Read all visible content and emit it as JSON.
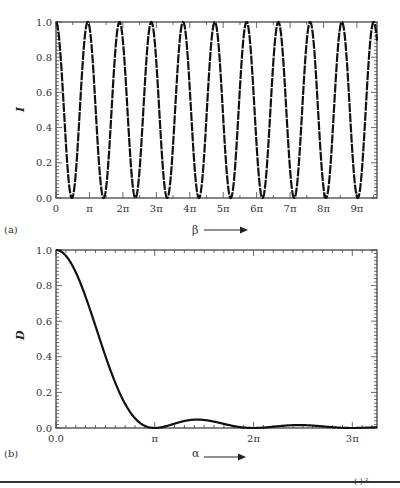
{
  "chart_data": [
    {
      "panel": "(a)",
      "type": "line",
      "title": "",
      "xlabel": "β",
      "ylabel": "I",
      "xlim_pi_units": [
        0,
        9.5
      ],
      "ylim": [
        0.0,
        1.0
      ],
      "grid": false,
      "xtick_labels": [
        "0",
        "π",
        "2π",
        "3π",
        "4π",
        "5π",
        "6π",
        "7π",
        "8π",
        "9π"
      ],
      "ytick_labels": [
        "0.0",
        "0.2",
        "0.4",
        "0.6",
        "0.8",
        "1.0"
      ],
      "series": [
        {
          "name": "I(β)",
          "function": "cos²(β/2) oscillation, period ≈ π",
          "x_pi_units": [
            0,
            0.45,
            0.95,
            1.45,
            1.9,
            2.4,
            2.85,
            3.35,
            3.8,
            4.3,
            4.75,
            5.25,
            5.7,
            6.2,
            6.65,
            7.15,
            7.6,
            8.1,
            8.55,
            9.05,
            9.5
          ],
          "values": [
            1.0,
            0.0,
            1.0,
            0.0,
            1.0,
            0.0,
            1.0,
            0.0,
            1.0,
            0.0,
            1.0,
            0.0,
            1.0,
            0.0,
            1.0,
            0.0,
            1.0,
            0.0,
            1.0,
            0.0,
            0.0
          ]
        }
      ]
    },
    {
      "panel": "(b)",
      "type": "line",
      "title": "",
      "xlabel": "α",
      "ylabel": "D",
      "xlim_pi_units": [
        0,
        3.2
      ],
      "ylim": [
        0.0,
        1.0
      ],
      "grid": false,
      "xtick_labels": [
        "0.0",
        "π",
        "2π",
        "3π"
      ],
      "ytick_labels": [
        "0.0",
        "0.2",
        "0.4",
        "0.6",
        "0.8",
        "1.0"
      ],
      "series": [
        {
          "name": "D(α) = (sin α / α)²",
          "x_pi_units": [
            0,
            0.25,
            0.5,
            0.75,
            1.0,
            1.25,
            1.43,
            1.75,
            2.0,
            2.25,
            2.46,
            2.75,
            3.0,
            3.2
          ],
          "values": [
            1.0,
            0.81,
            0.405,
            0.09,
            0.0,
            0.052,
            0.047,
            0.017,
            0.0,
            0.01,
            0.016,
            0.006,
            0.0,
            0.003
          ]
        }
      ]
    }
  ],
  "labels": {
    "panel_a": "(a)",
    "panel_b": "(b)",
    "x_a": "β",
    "x_b": "α",
    "y_a": "I",
    "y_b": "D"
  }
}
